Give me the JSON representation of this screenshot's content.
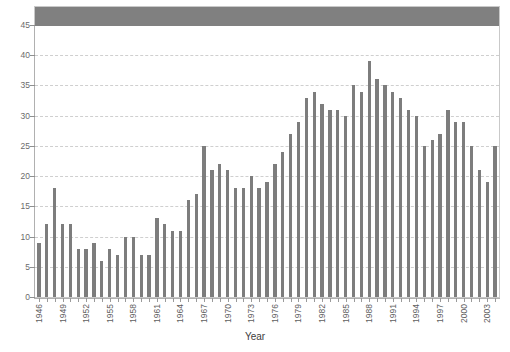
{
  "chart_data": {
    "type": "bar",
    "title": "",
    "xlabel": "Year",
    "ylabel": "",
    "ylim": [
      0,
      45
    ],
    "ytick_step": 5,
    "yticks": [
      0,
      5,
      10,
      15,
      20,
      25,
      30,
      35,
      40,
      45
    ],
    "grid": true,
    "gridlines_at": [
      5,
      10,
      15,
      20,
      25,
      30,
      35,
      40
    ],
    "legend": null,
    "bar_color": "#7d7d7d",
    "header_band_color": "#808080",
    "xtick_label_interval": 3,
    "xtick_labels_shown": [
      "1946",
      "1949",
      "1952",
      "1955",
      "1958",
      "1961",
      "1964",
      "1967",
      "1970",
      "1973",
      "1976",
      "1979",
      "1982",
      "1985",
      "1988",
      "1991",
      "1994",
      "1997",
      "2000",
      "2003"
    ],
    "categories": [
      "1946",
      "1947",
      "1948",
      "1949",
      "1950",
      "1951",
      "1952",
      "1953",
      "1954",
      "1955",
      "1956",
      "1957",
      "1958",
      "1959",
      "1960",
      "1961",
      "1962",
      "1963",
      "1964",
      "1965",
      "1966",
      "1967",
      "1968",
      "1969",
      "1970",
      "1971",
      "1972",
      "1973",
      "1974",
      "1975",
      "1976",
      "1977",
      "1978",
      "1979",
      "1980",
      "1981",
      "1982",
      "1983",
      "1984",
      "1985",
      "1986",
      "1987",
      "1988",
      "1989",
      "1990",
      "1991",
      "1992",
      "1993",
      "1994",
      "1995",
      "1996",
      "1997",
      "1998",
      "1999",
      "2000",
      "2001",
      "2002",
      "2003",
      "2004"
    ],
    "values": [
      9,
      12,
      18,
      12,
      12,
      8,
      8,
      9,
      6,
      8,
      7,
      10,
      10,
      7,
      7,
      13,
      12,
      11,
      11,
      16,
      17,
      25,
      21,
      22,
      21,
      18,
      18,
      20,
      18,
      19,
      22,
      24,
      27,
      29,
      33,
      34,
      32,
      31,
      31,
      30,
      35,
      34,
      39,
      36,
      35,
      34,
      33,
      31,
      30,
      25,
      26,
      27,
      31,
      29,
      29,
      25,
      21,
      19,
      25
    ]
  },
  "axes": {
    "x_title": "Year"
  }
}
